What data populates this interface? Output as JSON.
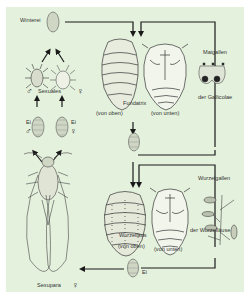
{
  "diagram": {
    "background_color": "#e4f1dc",
    "line_color": "#1a1a1a",
    "labels": {
      "winterei": "Winterei",
      "sexuales": "Sexuales",
      "ei_male": "Ei",
      "ei_female": "Ei",
      "fundatrix": "Fundatrix",
      "von_oben_1": "(von oben)",
      "von_unten_1": "(von unten)",
      "maigallen": "Maigallen",
      "der_gallicolae": "der Gallicolae",
      "wurzelgallen": "Wurzelgallen",
      "der_wurzellaeuse": "der Wurzelläuse",
      "wurzellaus": "Wurzellaus",
      "von_oben_2": "(von oben)",
      "von_unten_2": "(von unten)",
      "ei_bottom": "Ei",
      "sexupara": "Sexupara"
    },
    "symbols": {
      "male": "♂",
      "female": "♀"
    }
  }
}
